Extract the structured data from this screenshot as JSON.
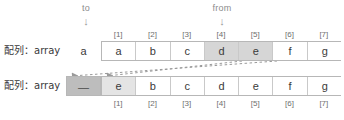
{
  "pointers": {
    "to": {
      "label": "to",
      "arrow": "↓"
    },
    "from": {
      "label": "from",
      "arrow": "↓"
    }
  },
  "indices": [
    "[1]",
    "[2]",
    "[3]",
    "[4]",
    "[5]",
    "[6]",
    "[7]"
  ],
  "top_row": {
    "label": "配列：array",
    "lead_value": "a",
    "cells": [
      {
        "value": "a",
        "state": "normal"
      },
      {
        "value": "b",
        "state": "normal"
      },
      {
        "value": "c",
        "state": "normal"
      },
      {
        "value": "d",
        "state": "highlight"
      },
      {
        "value": "e",
        "state": "highlight"
      },
      {
        "value": "f",
        "state": "normal"
      },
      {
        "value": "g",
        "state": "normal"
      }
    ]
  },
  "bottom_row": {
    "label": "配列：array",
    "lead_value": "—",
    "cells": [
      {
        "value": "e",
        "state": "highlight-light"
      },
      {
        "value": "b",
        "state": "normal"
      },
      {
        "value": "c",
        "state": "normal"
      },
      {
        "value": "d",
        "state": "normal"
      },
      {
        "value": "e",
        "state": "normal"
      },
      {
        "value": "f",
        "state": "normal"
      },
      {
        "value": "g",
        "state": "normal"
      }
    ]
  },
  "colors": {
    "border": "#b7b7b7",
    "highlight": "#d6d6d6",
    "highlight_light": "#e4e4e4",
    "lead_fill": "#bdbdbd",
    "arrow": "#9a9a9a",
    "label_text": "#8c8c8c"
  },
  "arrows": [
    {
      "name": "copy-arrow-from-index-5",
      "x1": 277,
      "y1": 61,
      "x2": 71,
      "y2": 76
    },
    {
      "name": "copy-arrow-from-index-4",
      "x1": 242,
      "y1": 61,
      "x2": 106,
      "y2": 76
    }
  ]
}
